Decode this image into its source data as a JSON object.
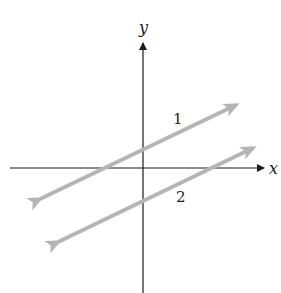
{
  "diagram": {
    "axes": {
      "x_label": "x",
      "y_label": "y",
      "color": "#1a1a1a"
    },
    "lines": [
      {
        "label": "1",
        "from": [
          33,
          202
        ],
        "to": [
          241,
          103
        ],
        "color": "#b5b5b5"
      },
      {
        "label": "2",
        "from": [
          51,
          245
        ],
        "to": [
          258,
          145
        ],
        "color": "#b5b5b5"
      }
    ]
  }
}
